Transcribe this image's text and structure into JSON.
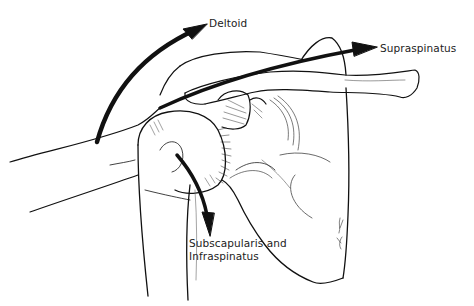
{
  "figure": {
    "style": "black ink line illustration on white background",
    "colors": {
      "background": "#ffffff",
      "line": "#111111",
      "arrow": "#111111",
      "text": "#222222"
    }
  },
  "labels": {
    "deltoid": "Deltoid",
    "supraspinatus": "Supraspinatus",
    "subscapularis_line1": "Subscapularis and",
    "subscapularis_line2": "Infraspinatus"
  },
  "arrows": [
    {
      "name": "deltoid-arrow",
      "direction": "up-right arc",
      "label_ref": "labels.deltoid"
    },
    {
      "name": "supraspinatus-arrow",
      "direction": "right",
      "label_ref": "labels.supraspinatus"
    },
    {
      "name": "subscapularis-infraspinatus-arrow",
      "direction": "down",
      "label_ref": "labels.subscapularis_line1"
    }
  ]
}
